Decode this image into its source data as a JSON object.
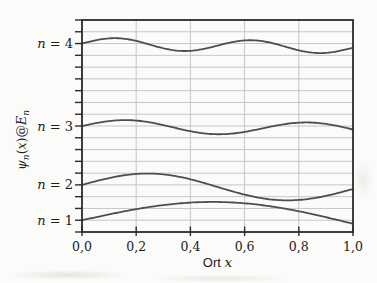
{
  "figure": {
    "background_color": "#fbfbf9",
    "frame_color": "#2b2b2b",
    "grid_color": "#c6c6c6",
    "curve_color": "#4e4e4e",
    "text_color": "#1c1c1c"
  },
  "chart_data": {
    "type": "line",
    "title": "",
    "xlabel": "Ort x",
    "xlabel_parts": {
      "prefix": "Ort",
      "variable": "x"
    },
    "ylabel": "ψn(x)@En",
    "ylabel_parts": {
      "psi": "ψ",
      "sub_n": "n",
      "open_paren": "(",
      "x_var": "x",
      "close_at": ")@",
      "E_sym": "E"
    },
    "xlim": [
      0,
      1
    ],
    "ylim": [
      0,
      18
    ],
    "x_ticks": {
      "values": [
        0,
        0.2,
        0.4,
        0.6,
        0.8,
        1
      ],
      "labels": [
        "0,0",
        "0,2",
        "0,4",
        "0,6",
        "0,8",
        "1,0"
      ]
    },
    "y_ticks": {
      "min": 0,
      "max": 18,
      "step": 1,
      "labels_shown": false
    },
    "grid": {
      "horizontal_step": 1,
      "vertical_values": [
        0.2,
        0.4,
        0.6,
        0.8
      ]
    },
    "formula": "psi_n(x) = E_n + A_n*sin(n*pi*x) + tilt*x, with E_n = n^2",
    "series": [
      {
        "label": "n = 4",
        "label_var": "n",
        "label_rest": " = 4",
        "n": 4,
        "energy": 16,
        "amplitude": 0.5,
        "tilt": -0.35
      },
      {
        "label": "n = 3",
        "label_var": "n",
        "label_rest": " = 3",
        "n": 3,
        "energy": 9,
        "amplitude": 0.55,
        "tilt": -0.3
      },
      {
        "label": "n = 2",
        "label_var": "n",
        "label_rest": " = 2",
        "n": 2,
        "energy": 4,
        "amplitude": 1.05,
        "tilt": -0.35
      },
      {
        "label": "n = 1",
        "label_var": "n",
        "label_rest": " = 1",
        "n": 1,
        "energy": 1,
        "amplitude": 1.7,
        "tilt": -0.3
      }
    ]
  }
}
